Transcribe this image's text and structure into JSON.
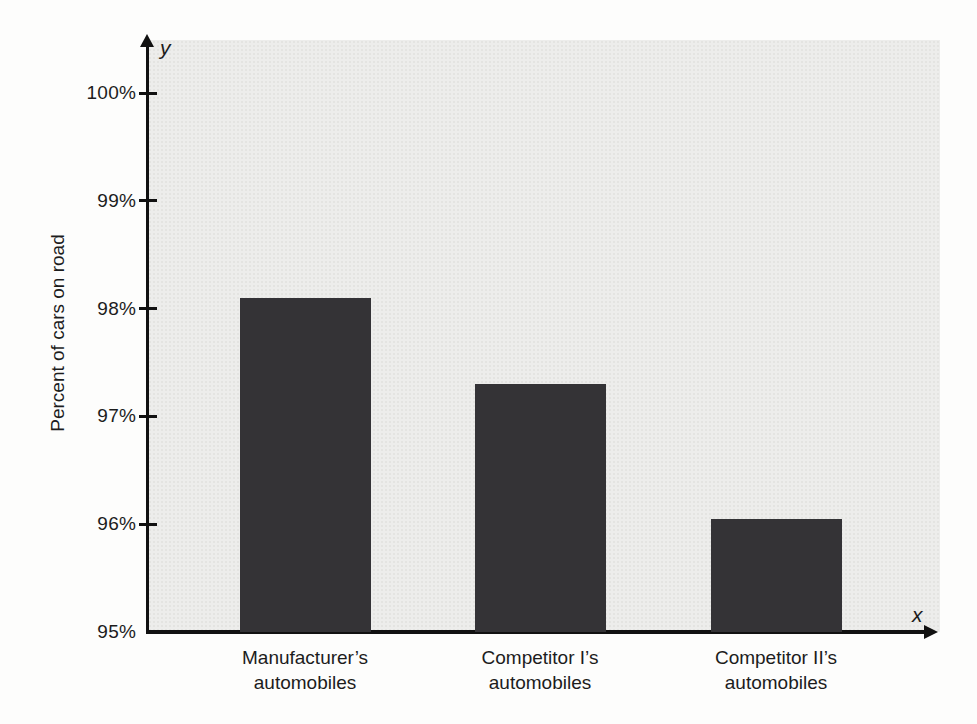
{
  "chart_data": {
    "type": "bar",
    "title": "",
    "xlabel": "",
    "ylabel": "Percent of cars on road",
    "x_axis_letter": "x",
    "y_axis_letter": "y",
    "categories": [
      "Manufacturer’s\nautomobiles",
      "Competitor I’s\nautomobiles",
      "Competitor II’s\nautomobiles"
    ],
    "values": [
      98.1,
      97.3,
      96.05
    ],
    "ylim": [
      95,
      100
    ],
    "yticks": [
      {
        "value": 100,
        "label": "100%"
      },
      {
        "value": 99,
        "label": "99%"
      },
      {
        "value": 98,
        "label": "98%"
      },
      {
        "value": 97,
        "label": "97%"
      },
      {
        "value": 96,
        "label": "96%"
      },
      {
        "value": 95,
        "label": "95%"
      }
    ],
    "grid": false,
    "legend": null,
    "bar_color": "#343336",
    "plot_bg": "#ededeb",
    "axis_color": "#111111"
  }
}
